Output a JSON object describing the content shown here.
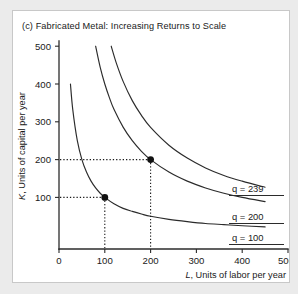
{
  "figure": {
    "title": "(c) Fabricated Metal: Increasing Returns to Scale",
    "panel_background": "#ffffff",
    "page_background": "#ebebeb",
    "border_color": "#c8c8c8"
  },
  "chart_data": {
    "type": "line",
    "title": "(c) Fabricated Metal: Increasing Returns to Scale",
    "xlabel": "L, Units of labor per year",
    "ylabel": "K, Units of capital per year",
    "xlim": [
      0,
      500
    ],
    "ylim": [
      0,
      500
    ],
    "xticks": [
      0,
      100,
      200,
      300,
      400,
      500
    ],
    "yticks": [
      100,
      200,
      300,
      400,
      500
    ],
    "xtick_labels": [
      "0",
      "100",
      "200",
      "300",
      "400",
      "500"
    ],
    "ytick_labels": [
      "100",
      "200",
      "300",
      "400",
      "500"
    ],
    "grid": false,
    "legend_position": "inline-right",
    "series": [
      {
        "name": "q = 100",
        "label": "q = 100",
        "curve_type": "isoquant",
        "constant": 10000,
        "x": [
          25,
          30,
          40,
          50,
          60,
          70,
          80,
          90,
          100,
          120,
          140,
          160,
          180,
          200,
          240,
          280,
          320,
          360,
          400,
          450,
          500
        ],
        "y": [
          400,
          333,
          250,
          200,
          167,
          143,
          125,
          111,
          100,
          83,
          71,
          63,
          56,
          50,
          42,
          36,
          31,
          28,
          25,
          22,
          20
        ]
      },
      {
        "name": "q = 200",
        "label": "q = 200",
        "curve_type": "isoquant",
        "constant": 40000,
        "x": [
          80,
          90,
          100,
          110,
          120,
          140,
          160,
          180,
          200,
          240,
          280,
          320,
          360,
          400,
          450,
          500
        ],
        "y": [
          500,
          444,
          400,
          364,
          333,
          286,
          250,
          222,
          200,
          167,
          143,
          125,
          111,
          100,
          89,
          80
        ]
      },
      {
        "name": "q = 239",
        "label": "q = 239",
        "curve_type": "isoquant",
        "constant": 57000,
        "x": [
          114,
          125,
          140,
          160,
          180,
          200,
          240,
          280,
          320,
          360,
          400,
          450,
          500
        ],
        "y": [
          500,
          456,
          407,
          356,
          317,
          285,
          238,
          204,
          178,
          158,
          143,
          127,
          114
        ]
      }
    ],
    "annotations": [
      {
        "name": "point-100-100",
        "x": 100,
        "y": 100,
        "on_series": "q = 100",
        "marker": "filled-circle",
        "guides": [
          "horizontal-to-axis",
          "vertical-to-axis"
        ]
      },
      {
        "name": "point-200-200",
        "x": 200,
        "y": 200,
        "on_series": "q = 200",
        "marker": "filled-circle",
        "guides": [
          "horizontal-to-axis",
          "vertical-to-axis"
        ]
      }
    ],
    "curve_labels": [
      {
        "text": "q = 239",
        "x_px": 231,
        "y_px": 191
      },
      {
        "text": "q = 200",
        "x_px": 231,
        "y_px": 219
      },
      {
        "text": "q = 100",
        "x_px": 231,
        "y_px": 240
      }
    ]
  },
  "axes": {
    "y_axis_label_italic_part": "K",
    "y_axis_label_rest": ", Units of capital per year",
    "x_axis_label_italic_part": "L",
    "x_axis_label_rest": ", Units of labor per year"
  }
}
